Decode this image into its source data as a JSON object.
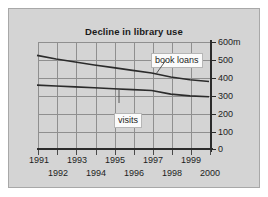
{
  "chart_data": {
    "type": "line",
    "title": "Decline in library use",
    "xlabel": "",
    "ylabel": "",
    "yunit": "m",
    "ylim": [
      0,
      600
    ],
    "yticks": [
      0,
      100,
      200,
      300,
      400,
      500,
      600
    ],
    "ytick_labels": [
      "0",
      "100",
      "200",
      "300",
      "400",
      "500",
      "600m"
    ],
    "xlim": [
      1991,
      2000
    ],
    "x": [
      1991,
      1992,
      1993,
      1994,
      1995,
      1996,
      1997,
      1998,
      1999,
      2000
    ],
    "xtick_labels_row1": [
      "1991",
      "1993",
      "1995",
      "1997",
      "1999"
    ],
    "xtick_labels_row2": [
      "1992",
      "1994",
      "1996",
      "1998",
      "2000"
    ],
    "grid": true,
    "legend_position": "inline-callout",
    "series": [
      {
        "name": "book loans",
        "values": [
          520,
          500,
          483,
          467,
          452,
          437,
          422,
          400,
          385,
          375
        ]
      },
      {
        "name": "visits",
        "values": [
          355,
          350,
          345,
          340,
          335,
          330,
          325,
          305,
          295,
          290
        ]
      }
    ],
    "annotations": [
      {
        "label": "book loans",
        "points_to_series": "book loans"
      },
      {
        "label": "visits",
        "points_to_series": "visits"
      }
    ]
  },
  "panel": {
    "background_color": "#d4d4d4",
    "border_color": "#a8a8a8"
  },
  "axis_color": "#2b2b2b",
  "grid_color": "#8f8f8f",
  "line_color": "#2b2b2b"
}
